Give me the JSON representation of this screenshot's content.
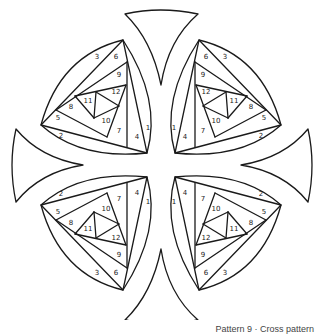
{
  "caption": "Pattern 9 · Cross pattern",
  "figure": {
    "title": "Cross pattern",
    "pattern_number": 9,
    "quadrants": [
      "top-left",
      "top-right",
      "bottom-left",
      "bottom-right"
    ],
    "piece_numbers": [
      "1",
      "2",
      "3",
      "4",
      "5",
      "6",
      "7",
      "8",
      "9",
      "10",
      "11",
      "12"
    ],
    "arms": [
      "top-arm",
      "left-arm",
      "right-arm",
      "bottom-arm"
    ]
  },
  "labels": {
    "n1": "1",
    "n2": "2",
    "n3": "3",
    "n4": "4",
    "n5": "5",
    "n6": "6",
    "n7": "7",
    "n8": "8",
    "n9": "9",
    "n10": "10",
    "n11": "11",
    "n12": "12"
  }
}
